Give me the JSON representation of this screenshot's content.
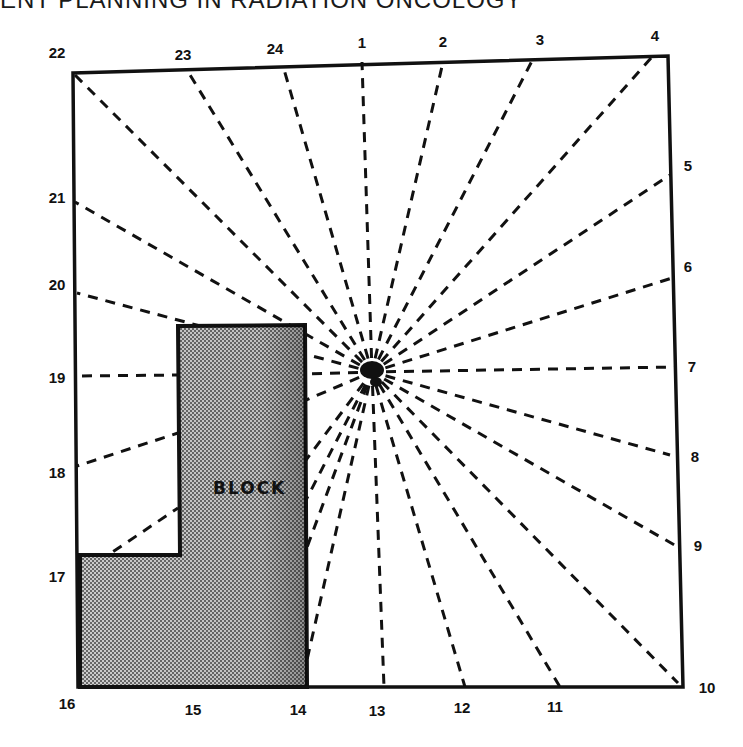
{
  "header": {
    "text": "ENT PLANNING IN RADIATION ONCOLOGY"
  },
  "diagram": {
    "block_label": "BLOCK",
    "source_point": "center",
    "points": [
      {
        "id": "1",
        "label": "1",
        "side": "top"
      },
      {
        "id": "2",
        "label": "2",
        "side": "top"
      },
      {
        "id": "3",
        "label": "3",
        "side": "top"
      },
      {
        "id": "4",
        "label": "4",
        "side": "top-right-corner"
      },
      {
        "id": "5",
        "label": "5",
        "side": "right"
      },
      {
        "id": "6",
        "label": "6",
        "side": "right"
      },
      {
        "id": "7",
        "label": "7",
        "side": "right"
      },
      {
        "id": "8",
        "label": "8",
        "side": "right"
      },
      {
        "id": "9",
        "label": "9",
        "side": "right"
      },
      {
        "id": "10",
        "label": "10",
        "side": "bottom-right-corner"
      },
      {
        "id": "11",
        "label": "11",
        "side": "bottom"
      },
      {
        "id": "12",
        "label": "12",
        "side": "bottom"
      },
      {
        "id": "13",
        "label": "13",
        "side": "bottom"
      },
      {
        "id": "14",
        "label": "14",
        "side": "bottom"
      },
      {
        "id": "15",
        "label": "15",
        "side": "bottom"
      },
      {
        "id": "16",
        "label": "16",
        "side": "bottom-left-corner"
      },
      {
        "id": "17",
        "label": "17",
        "side": "left"
      },
      {
        "id": "18",
        "label": "18",
        "side": "left"
      },
      {
        "id": "19",
        "label": "19",
        "side": "left"
      },
      {
        "id": "20",
        "label": "20",
        "side": "left"
      },
      {
        "id": "21",
        "label": "21",
        "side": "left"
      },
      {
        "id": "22",
        "label": "22",
        "side": "top-left-corner"
      },
      {
        "id": "23",
        "label": "23",
        "side": "top"
      },
      {
        "id": "24",
        "label": "24",
        "side": "top"
      }
    ],
    "blocked_points": [
      "14",
      "15",
      "16",
      "17",
      "18",
      "19"
    ]
  }
}
